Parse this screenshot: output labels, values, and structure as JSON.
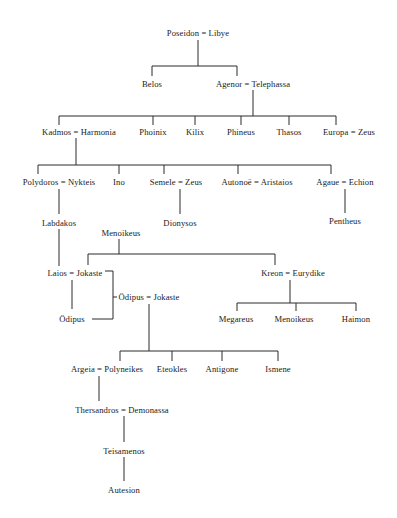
{
  "diagram": {
    "type": "genealogy-tree",
    "nodes": [
      {
        "id": "poseidon-libye",
        "label": "Poseidon = Libye",
        "x": 198,
        "y": 28
      },
      {
        "id": "belos",
        "label": "Belos",
        "x": 152,
        "y": 79
      },
      {
        "id": "agenor-telephassa",
        "label": "Agenor = Telephassa",
        "x": 253,
        "y": 79
      },
      {
        "id": "kadmos-harmonia",
        "label": "Kadmos = Harmonia",
        "x": 79,
        "y": 127
      },
      {
        "id": "phoinix",
        "label": "Phoinix",
        "x": 153,
        "y": 127
      },
      {
        "id": "kilix",
        "label": "Kilix",
        "x": 195,
        "y": 127
      },
      {
        "id": "phineus",
        "label": "Phineus",
        "x": 241,
        "y": 127
      },
      {
        "id": "thasos",
        "label": "Thasos",
        "x": 289,
        "y": 127
      },
      {
        "id": "europa-zeus",
        "label": "Europa = Zeus",
        "x": 349,
        "y": 127
      },
      {
        "id": "polydoros-nykteis",
        "label": "Polydoros = Nykteis",
        "x": 59,
        "y": 177
      },
      {
        "id": "ino",
        "label": "Ino",
        "x": 119,
        "y": 177
      },
      {
        "id": "semele-zeus",
        "label": "Semele = Zeus",
        "x": 176,
        "y": 177
      },
      {
        "id": "autonoe-aristaios",
        "label": "Autonoë = Aristaios",
        "x": 257,
        "y": 177
      },
      {
        "id": "agaue-echion",
        "label": "Agaue = Echion",
        "x": 345,
        "y": 177
      },
      {
        "id": "labdakos",
        "label": "Labdakos",
        "x": 59,
        "y": 218
      },
      {
        "id": "dionysos",
        "label": "Dionysos",
        "x": 180,
        "y": 218
      },
      {
        "id": "pentheus",
        "label": "Pentheus",
        "x": 345,
        "y": 216
      },
      {
        "id": "menoikeus",
        "label": "Menoikeus",
        "x": 121,
        "y": 228
      },
      {
        "id": "laios-jokaste",
        "label": "Laios = Jokaste",
        "x": 75,
        "y": 268
      },
      {
        "id": "kreon-eurydike",
        "label": "Kreon = Eurydike",
        "x": 293,
        "y": 268
      },
      {
        "id": "odipus-son",
        "label": "Ödipus",
        "x": 72,
        "y": 314
      },
      {
        "id": "odipus-jokaste",
        "label": "Ödipus = Jokaste",
        "x": 149,
        "y": 292
      },
      {
        "id": "megareus",
        "label": "Megareus",
        "x": 236,
        "y": 314
      },
      {
        "id": "menoikeus-2",
        "label": "Menoikeus",
        "x": 294,
        "y": 314
      },
      {
        "id": "haimon",
        "label": "Haimon",
        "x": 356,
        "y": 314
      },
      {
        "id": "argeia-polyneikes",
        "label": "Argeia = Polyneikes",
        "x": 107,
        "y": 364
      },
      {
        "id": "eteokles",
        "label": "Eteokles",
        "x": 172,
        "y": 364
      },
      {
        "id": "antigone",
        "label": "Antigone",
        "x": 222,
        "y": 364
      },
      {
        "id": "ismene",
        "label": "Ismene",
        "x": 278,
        "y": 364
      },
      {
        "id": "thersandros-demonassa",
        "label": "Thersandros = Demonassa",
        "x": 122,
        "y": 405
      },
      {
        "id": "teisamenos",
        "label": "Teisamenos",
        "x": 124,
        "y": 446
      },
      {
        "id": "autesion",
        "label": "Autesion",
        "x": 124,
        "y": 485
      }
    ],
    "edges": [
      {
        "from": "poseidon-libye",
        "to": [
          "belos",
          "agenor-telephassa"
        ]
      },
      {
        "from": "agenor-telephassa",
        "to": [
          "kadmos-harmonia",
          "phoinix",
          "kilix",
          "phineus",
          "thasos",
          "europa-zeus"
        ]
      },
      {
        "from": "kadmos-harmonia",
        "to": [
          "polydoros-nykteis",
          "ino",
          "semele-zeus",
          "autonoe-aristaios",
          "agaue-echion"
        ]
      },
      {
        "from": "polydoros-nykteis",
        "to": [
          "labdakos"
        ]
      },
      {
        "from": "semele-zeus",
        "to": [
          "dionysos"
        ]
      },
      {
        "from": "agaue-echion",
        "to": [
          "pentheus"
        ]
      },
      {
        "from": "labdakos",
        "to": [
          "laios-jokaste"
        ]
      },
      {
        "from": "menoikeus",
        "to": [
          "laios-jokaste",
          "kreon-eurydike"
        ]
      },
      {
        "from": "laios-jokaste",
        "to": [
          "odipus-son"
        ]
      },
      {
        "from": "kreon-eurydike",
        "to": [
          "megareus",
          "menoikeus-2",
          "haimon"
        ]
      },
      {
        "from": "odipus-jokaste",
        "to": [
          "argeia-polyneikes",
          "eteokles",
          "antigone",
          "ismene"
        ]
      },
      {
        "from": "argeia-polyneikes",
        "to": [
          "thersandros-demonassa"
        ]
      },
      {
        "from": "thersandros-demonassa",
        "to": [
          "teisamenos"
        ]
      },
      {
        "from": "teisamenos",
        "to": [
          "autesion"
        ]
      }
    ],
    "identity_links": [
      {
        "note": "bracket joins Jokaste (wife of Laios) and Ödipus (son) to the couple Ödipus = Jokaste",
        "members": [
          "laios-jokaste",
          "odipus-son",
          "odipus-jokaste"
        ]
      }
    ],
    "line_color": "#2a2a2a",
    "text_color": "#1a1a1a"
  }
}
